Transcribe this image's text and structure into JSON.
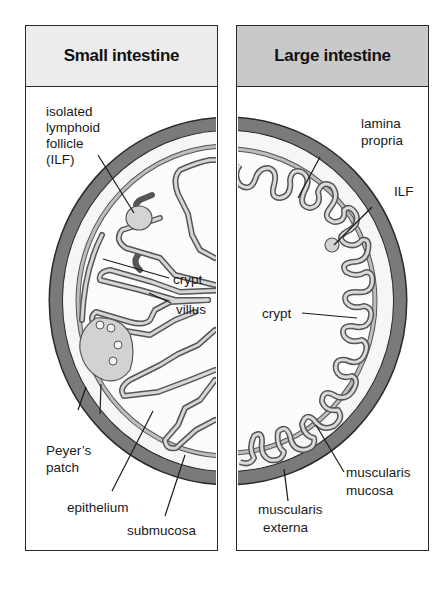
{
  "panels": {
    "small": {
      "title": "Small intestine",
      "header_color": "#ececec"
    },
    "large": {
      "title": "Large intestine",
      "header_color": "#c9c9c9"
    }
  },
  "colors": {
    "muscularis_externa": "#7a7a7a",
    "muscularis_mucosa": "#b0b0b0",
    "lamina_propria_fill": "#f2f2f2",
    "lymphoid_fill": "#d4d4d4",
    "outline": "#2a2a2a"
  },
  "labels": {
    "small": {
      "ilf": [
        "isolated",
        "lymphoid",
        "follicle",
        "(ILF)"
      ],
      "crypt": "crypt",
      "villus": "villus",
      "peyers_patch": [
        "Peyer’s",
        "patch"
      ],
      "epithelium": "epithelium",
      "submucosa": "submucosa"
    },
    "large": {
      "lamina_propria": [
        "lamina",
        "propria"
      ],
      "ilf": "ILF",
      "crypt": "crypt",
      "muscularis_mucosa": [
        "muscularis",
        "mucosa"
      ],
      "muscularis_externa": [
        "muscularis",
        "externa"
      ]
    }
  }
}
